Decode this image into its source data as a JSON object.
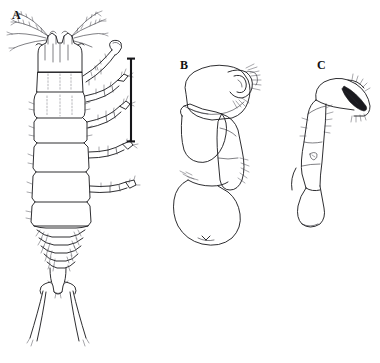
{
  "figure": {
    "type": "scientific-line-drawing-plate",
    "background_color": "#ffffff",
    "ink_color": "#16161a",
    "width": 380,
    "height": 363,
    "panel_count": 3
  },
  "panels": [
    {
      "id": "A",
      "label": "A",
      "label_x": 12,
      "label_y": 9,
      "view": "whole-animal-dorsal",
      "description": "whole body dorsal view with head appendages, segmented pereon, pleon, telson and long caudal rami"
    },
    {
      "id": "B",
      "label": "B",
      "label_x": 180,
      "label_y": 59,
      "view": "appendage",
      "description": "rounded multi-articulate appendage with setae"
    },
    {
      "id": "C",
      "label": "C",
      "label_x": 317,
      "label_y": 59,
      "view": "appendage-with-claw",
      "description": "elongate appendage bearing a dark sclerotised distal claw"
    }
  ],
  "scale_bar": {
    "name": "scale-bar",
    "orientation": "vertical",
    "x": 131,
    "y_top": 58,
    "y_bottom": 142,
    "length_px": 84,
    "cap_half_width": 4,
    "color": "#16161a",
    "caption": ""
  }
}
